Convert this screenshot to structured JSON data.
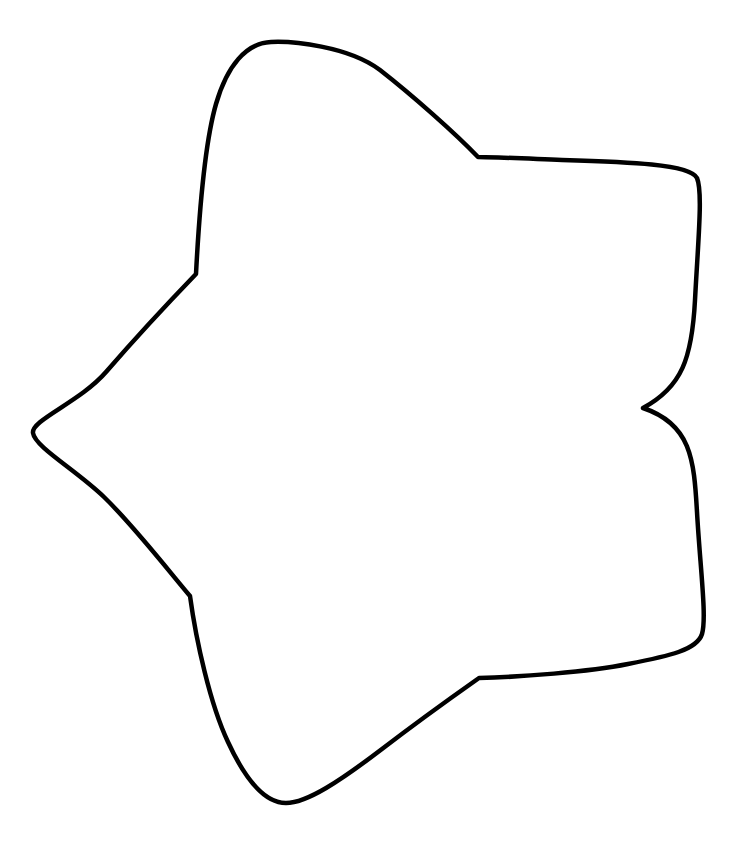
{
  "page": {
    "background_color": "#ffffff",
    "width": 744,
    "height": 849
  },
  "header": {
    "caption_text": "see this throughout the page 11",
    "caption_color": "#b9b9b9",
    "caption_note": "clipped by top edge of page — only lower sliver of glyphs visible"
  },
  "artwork": {
    "name": "five-pointed-rounded-star-outline",
    "description": "Hand-drawn style five-pointed star outline, unfilled, black contour line",
    "stroke_color": "#000000",
    "fill_color": "#ffffff",
    "stroke_width": 4.5,
    "bounding_box": {
      "x": 31,
      "y": 40,
      "width": 676,
      "height": 766
    },
    "vertices": {
      "outer_points": [
        {
          "name": "top-point",
          "x": 271,
          "y": 42
        },
        {
          "name": "upper-right-point",
          "x": 699,
          "y": 178
        },
        {
          "name": "lower-right-point",
          "x": 704,
          "y": 634
        },
        {
          "name": "bottom-point",
          "x": 286,
          "y": 803
        },
        {
          "name": "left-point",
          "x": 33,
          "y": 433
        }
      ],
      "inner_notches": [
        {
          "name": "upper-right-notch",
          "x": 478,
          "y": 157
        },
        {
          "name": "right-notch",
          "x": 643,
          "y": 408
        },
        {
          "name": "lower-right-notch",
          "x": 479,
          "y": 678
        },
        {
          "name": "lower-left-notch",
          "x": 190,
          "y": 596
        },
        {
          "name": "upper-left-notch",
          "x": 196,
          "y": 274
        }
      ]
    },
    "path_d": "M 271 42 C 246 43 227 66 216 104 C 205 142 199 216 196 274 C 169 302 132 342 106 372 C 80 402 31 420 33 433 C 35 447 76 470 104 497 C 133 525 168 570 190 596 C 196 640 210 704 228 742 C 246 781 266 803 286 803 C 307 803 340 781 382 749 C 425 716 462 690 479 678 C 520 677 588 672 628 664 C 669 656 697 650 702 634 C 707 618 700 566 697 512 C 694 459 691 424 643 408 C 682 387 692 358 695 300 C 698 242 703 192 697 178 C 690 164 628 162 562 160 C 512 158 490 157 478 157 C 455 133 412 95 380 70 C 348 46 292 41 271 42 Z"
  }
}
